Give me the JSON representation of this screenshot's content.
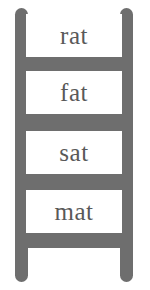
{
  "figure": {
    "type": "word-family-ladder",
    "word_family": "-at",
    "colors": {
      "ladder": "#6e6e6e",
      "panel": "#ffffff",
      "text": "#595959",
      "background": "#ffffff"
    }
  },
  "ladder": {
    "rails": [
      {
        "side": "left"
      },
      {
        "side": "right"
      }
    ],
    "rungs": [
      {
        "index": 0,
        "word": "rat"
      },
      {
        "index": 1,
        "word": "fat"
      },
      {
        "index": 2,
        "word": "sat"
      },
      {
        "index": 3,
        "word": "mat"
      }
    ]
  }
}
